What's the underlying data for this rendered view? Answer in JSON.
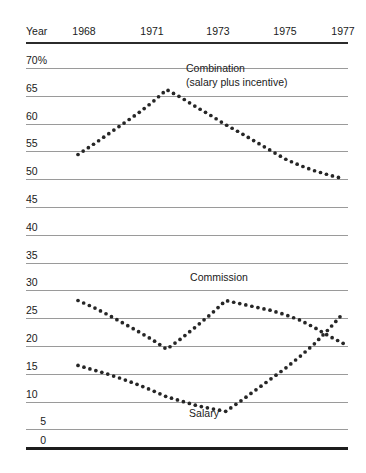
{
  "axis": {
    "year_label": "Year",
    "x_ticks": [
      {
        "label": "1968",
        "value": 1968
      },
      {
        "label": "1971",
        "value": 1971
      },
      {
        "label": "1973",
        "value": 1973
      },
      {
        "label": "1975",
        "value": 1975
      },
      {
        "label": "1977",
        "value": 1977
      }
    ],
    "y_ticks": [
      {
        "label": "70%",
        "value": 70
      },
      {
        "label": "65",
        "value": 65
      },
      {
        "label": "60",
        "value": 60
      },
      {
        "label": "55",
        "value": 55
      },
      {
        "label": "50",
        "value": 50
      },
      {
        "label": "45",
        "value": 45
      },
      {
        "label": "40",
        "value": 40
      },
      {
        "label": "35",
        "value": 35
      },
      {
        "label": "30",
        "value": 30
      },
      {
        "label": "25",
        "value": 25
      },
      {
        "label": "20",
        "value": 20
      },
      {
        "label": "15",
        "value": 15
      },
      {
        "label": "10",
        "value": 10
      },
      {
        "label": "5",
        "value": 5
      },
      {
        "label": "0",
        "value": 0
      }
    ]
  },
  "annotations": [
    {
      "name": "combination",
      "line1": "Combination",
      "line2": "(salary plus incentive)"
    },
    {
      "name": "commission",
      "line1": "Commission",
      "line2": ""
    },
    {
      "name": "salary",
      "line1": "Salary",
      "line2": ""
    }
  ],
  "colors": {
    "ink": "#1a1a1a",
    "gridline": "#9a9a9a",
    "baseline": "#1d1d1d",
    "dots": "#262626"
  },
  "chart_data": {
    "type": "line",
    "title": "",
    "subtitle": "",
    "xlabel": "Year",
    "ylabel": "",
    "xlim": [
      1967.6,
      1977.6
    ],
    "ylim": [
      0,
      70
    ],
    "grid": true,
    "legend": "inline-annotations",
    "line_style": "dotted",
    "x": [
      1968,
      1968.5,
      1969,
      1969.5,
      1970,
      1970.5,
      1971,
      1971.5,
      1972,
      1972.5,
      1973,
      1973.5,
      1974,
      1974.5,
      1975,
      1975.5,
      1976,
      1976.5,
      1977
    ],
    "series": [
      {
        "name": "Combination (salary plus incentive)",
        "values": [
          54.0,
          55.8,
          57.7,
          59.6,
          61.5,
          63.6,
          66.0,
          64.5,
          62.8,
          61.2,
          59.5,
          58.0,
          56.4,
          54.8,
          53.2,
          52.0,
          51.0,
          50.2,
          49.5
        ]
      },
      {
        "name": "Commission",
        "values": [
          27.0,
          25.8,
          24.4,
          22.9,
          21.4,
          19.8,
          18.0,
          20.0,
          22.2,
          24.5,
          27.0,
          26.4,
          25.8,
          25.2,
          24.4,
          23.4,
          22.0,
          20.4,
          19.0
        ]
      },
      {
        "name": "Salary",
        "values": [
          15.0,
          14.2,
          13.4,
          12.5,
          11.5,
          10.4,
          9.2,
          8.4,
          7.6,
          7.0,
          6.5,
          8.4,
          10.4,
          12.4,
          14.4,
          16.6,
          19.0,
          21.8,
          24.8
        ]
      }
    ],
    "notes": [
      "Combination peaks at about 66% in 1971 and declines steadily to about 49.5% in 1977.",
      "Commission starts near 27%, dips to about 18% in 1971, returns to about 27% in 1973, then falls to about 19%.",
      "Salary declines from 15% to a low near 6.5% in 1973 then rises sharply to about 25%, crossing Commission near 21% around 1976."
    ]
  }
}
